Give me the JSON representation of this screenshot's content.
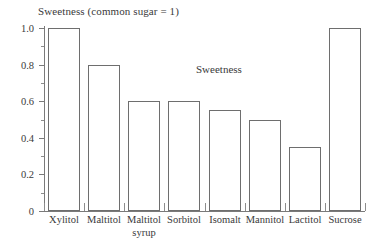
{
  "chart_data": {
    "type": "bar",
    "title": "Sweetness (common sugar = 1)",
    "annotation": "Sweetness",
    "xlabel": "",
    "ylabel": "",
    "ylim": [
      0,
      1.0
    ],
    "grid": false,
    "legend": "none",
    "categories": [
      "Xylitol",
      "Maltitol",
      "Maltitol syrup",
      "Sorbitol",
      "Isomalt",
      "Mannitol",
      "Lactitol",
      "Sucrose"
    ],
    "category_lines": [
      [
        "Xylitol"
      ],
      [
        "Maltitol"
      ],
      [
        "Maltitol",
        "syrup"
      ],
      [
        "Sorbitol"
      ],
      [
        "Isomalt"
      ],
      [
        "Mannitol"
      ],
      [
        "Lactitol"
      ],
      [
        "Sucrose"
      ]
    ],
    "values": [
      1.0,
      0.8,
      0.6,
      0.6,
      0.55,
      0.5,
      0.35,
      1.0
    ],
    "ytick_labels": [
      "0",
      "0.2",
      "0.4",
      "0.6",
      "0.8",
      "1.0"
    ],
    "ytick_values": [
      0,
      0.2,
      0.4,
      0.6,
      0.8,
      1.0
    ],
    "yminor_values": [
      0.1,
      0.3,
      0.5,
      0.7,
      0.9
    ],
    "colors": {
      "bar_fill": "#ffffff",
      "bar_stroke": "#6e6e6e",
      "axis": "#7a7a7a",
      "text": "#3a3a3a",
      "background": "#ffffff"
    }
  }
}
